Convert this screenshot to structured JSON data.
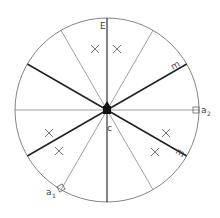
{
  "diagram": {
    "center": {
      "x": 107,
      "y": 110
    },
    "radius": 92,
    "spoke_angles_thin": [
      0,
      60,
      120,
      180,
      240,
      300
    ],
    "spoke_angles_thick": [
      30,
      150,
      210,
      330
    ],
    "spoke_angles_vertical": [
      90,
      270
    ],
    "labels": {
      "top": "E",
      "center": "c",
      "upper_right": "m",
      "lower_right": "m",
      "right_marker": "a",
      "right_marker_sub": "2",
      "left_marker": "a",
      "left_marker_sub": "1"
    },
    "x_marks": [
      {
        "x": 95,
        "y": 49
      },
      {
        "x": 117,
        "y": 49
      },
      {
        "x": 49,
        "y": 133
      },
      {
        "x": 59,
        "y": 151
      },
      {
        "x": 166,
        "y": 133
      },
      {
        "x": 155,
        "y": 152
      }
    ],
    "colors": {
      "thin": "#777777",
      "thick": "#222222",
      "circle": "#666666"
    }
  }
}
